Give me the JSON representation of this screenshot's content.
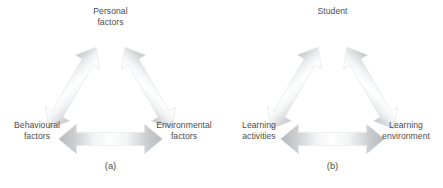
{
  "figure": {
    "background_color": "#ffffff",
    "text_color": "#4d4d4d",
    "arrow_dark_color": "#b6babe",
    "arrow_mid_color": "#d8dadc",
    "arrow_light_color": "#ffffff",
    "arrow_outline_color": "#e3e5e7"
  },
  "panels": [
    {
      "caption": "(a)",
      "nodes": {
        "top": {
          "line1": "Personal",
          "line2": "factors"
        },
        "left": {
          "line1": "Behavioural",
          "line2": "factors"
        },
        "right": {
          "line1": "Environmental",
          "line2": "factors"
        }
      }
    },
    {
      "caption": "(b)",
      "nodes": {
        "top": {
          "line1": "Student",
          "line2": ""
        },
        "left": {
          "line1": "Learning",
          "line2": "activities"
        },
        "right": {
          "line1": "Learning",
          "line2": "environment"
        }
      }
    }
  ]
}
